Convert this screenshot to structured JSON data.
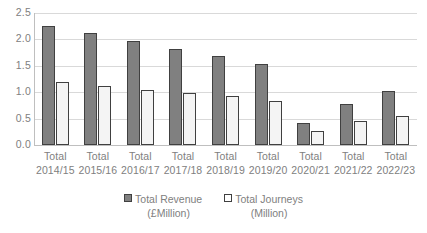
{
  "chart_data": {
    "type": "bar",
    "title": "",
    "xlabel": "",
    "ylabel": "",
    "ylim": [
      0,
      2.5
    ],
    "yticks": [
      "0.0",
      "0.5",
      "1.0",
      "1.5",
      "2.0",
      "2.5"
    ],
    "ytick_values": [
      0.0,
      0.5,
      1.0,
      1.5,
      2.0,
      2.5
    ],
    "grid": true,
    "legend_position": "bottom",
    "categories": [
      "Total 2014/15",
      "Total 2015/16",
      "Total 2016/17",
      "Total 2017/18",
      "Total 2018/19",
      "Total 2019/20",
      "Total 2020/21",
      "Total 2021/22",
      "Total 2022/23"
    ],
    "category_lines": [
      {
        "line1": "Total",
        "line2": "2014/15"
      },
      {
        "line1": "Total",
        "line2": "2015/16"
      },
      {
        "line1": "Total",
        "line2": "2016/17"
      },
      {
        "line1": "Total",
        "line2": "2017/18"
      },
      {
        "line1": "Total",
        "line2": "2018/19"
      },
      {
        "line1": "Total",
        "line2": "2019/20"
      },
      {
        "line1": "Total",
        "line2": "2020/21"
      },
      {
        "line1": "Total",
        "line2": "2021/22"
      },
      {
        "line1": "Total",
        "line2": "2022/23"
      }
    ],
    "series": [
      {
        "name": "Total Revenue (£Million)",
        "legend_line1": "Total Revenue",
        "legend_line2": "(£Million)",
        "color": "#808080",
        "border_color": "#404040",
        "values": [
          2.25,
          2.13,
          1.97,
          1.82,
          1.69,
          1.53,
          0.42,
          0.77,
          1.02
        ]
      },
      {
        "name": "Total Journeys (Million)",
        "legend_line1": "Total Journeys",
        "legend_line2": "(Million)",
        "color": "#f4f4f4",
        "border_color": "#404040",
        "values": [
          1.19,
          1.12,
          1.04,
          0.99,
          0.92,
          0.83,
          0.27,
          0.46,
          0.55
        ]
      }
    ]
  },
  "colors": {
    "revenue": "#808080",
    "journeys": "#f4f4f4",
    "bar_outline": "#404040",
    "gridline": "#d9d9d9",
    "axis": "#bfbfbf",
    "text": "#808080",
    "background": "#ffffff"
  }
}
